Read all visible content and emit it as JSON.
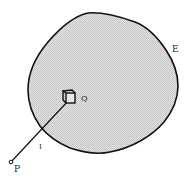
{
  "diagram": {
    "region_label": "E",
    "element_label": "Q",
    "point_label": "P",
    "line_label": "I",
    "colors": {
      "outline": "#111111",
      "fill": "#d9d9d9",
      "background": "#ffffff"
    }
  }
}
